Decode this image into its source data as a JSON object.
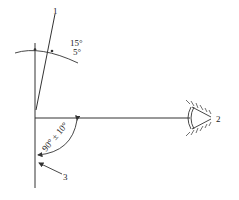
{
  "labels": {
    "item1": "1",
    "item2": "2",
    "item3": "3",
    "angle_top_upper": "15°",
    "angle_top_lower": "5°",
    "angle_bottom": "90° ± 10°"
  },
  "colors": {
    "stroke": "#333333",
    "background": "#ffffff"
  }
}
